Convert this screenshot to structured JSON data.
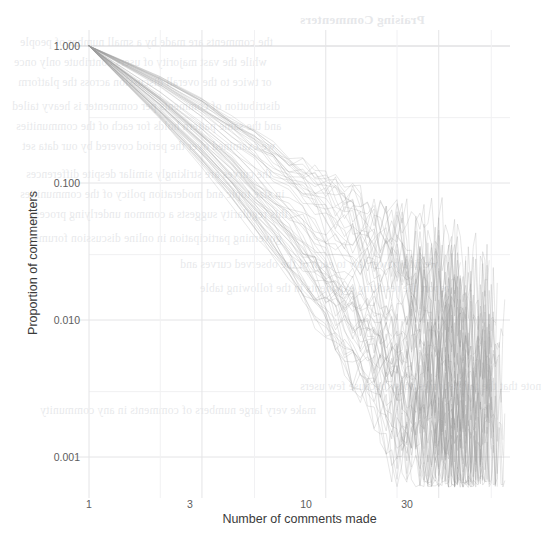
{
  "figure": {
    "background_color": "#ffffff",
    "line_color": "#9a9a9a",
    "grid_color": "#e4e4e6",
    "axis_text_color": "#3a3a3a",
    "tick_text_color": "#5d5d5d"
  },
  "chart_data": {
    "type": "line",
    "title": "",
    "xlabel": "Number of comments made",
    "ylabel": "Proportion of commenters",
    "xscale": "log",
    "yscale": "log",
    "xlim": [
      1,
      60
    ],
    "ylim": [
      0.0006,
      1.2
    ],
    "grid": true,
    "legend": null,
    "x_ticks": [
      {
        "value": 1,
        "label": "1"
      },
      {
        "value": 3,
        "label": "3"
      },
      {
        "value": 10,
        "label": "10"
      },
      {
        "value": 30,
        "label": "30"
      }
    ],
    "y_ticks": [
      {
        "value": 1.0,
        "label": "1.000"
      },
      {
        "value": 0.1,
        "label": "0.100"
      },
      {
        "value": 0.01,
        "label": "0.010"
      },
      {
        "value": 0.001,
        "label": "0.001"
      }
    ],
    "x_minor_gridlines": [
      2,
      5,
      20,
      50
    ],
    "series_count": 60,
    "series_summary": {
      "x": [
        1,
        2,
        3,
        4,
        5,
        6,
        7,
        8,
        10,
        12,
        15,
        20,
        25,
        30,
        40,
        50
      ],
      "median_values": [
        1.0,
        0.42,
        0.24,
        0.155,
        0.108,
        0.079,
        0.06,
        0.047,
        0.031,
        0.022,
        0.0145,
        0.0085,
        0.0056,
        0.004,
        0.0026,
        0.0019
      ],
      "upper_envelope": [
        1.0,
        0.6,
        0.41,
        0.3,
        0.235,
        0.19,
        0.157,
        0.133,
        0.1,
        0.078,
        0.056,
        0.036,
        0.025,
        0.019,
        0.012,
        0.009
      ],
      "lower_envelope": [
        1.0,
        0.29,
        0.132,
        0.073,
        0.044,
        0.029,
        0.02,
        0.0145,
        0.008,
        0.0049,
        0.0027,
        0.0012,
        0.0009,
        0.0008,
        0.0008,
        0.0008
      ]
    }
  },
  "background_bleed": {
    "visible": true,
    "note": "faint mirrored show-through of text from the reverse side of the printed page; not legible content",
    "heading_text": "Praising Commenters",
    "lines": [
      "the comments are made by a small number of people",
      "while the vast majority of users contribute only once",
      "or twice to the overall discussion across the platform",
      "distribution of comments per commenter is heavy tailed",
      "and the same pattern holds for each of the communities",
      "we examined over the period covered by our data set",
      "the curves are strikingly similar despite differences",
      "in size topic and moderation policy of the communities",
      "this regularity suggests a common underlying process",
      "governing participation in online discussion forums",
      "we fit a power law to each of the observed curves and",
      "report the resulting exponents in the following table",
      "note that the tail becomes noisy because few users",
      "make very large numbers of comments in any community"
    ]
  }
}
